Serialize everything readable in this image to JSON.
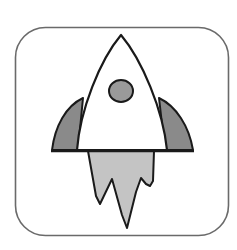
{
  "icon": {
    "name": "rocket-icon",
    "label": "Rocket",
    "colors": {
      "background": "#ffffff",
      "frame_stroke": "#6a6a6a",
      "outline": "#1a1a1a",
      "body_fill": "#ffffff",
      "fin_fill": "#8a8a8a",
      "porthole_fill": "#9a9a9a",
      "flame_fill": "#c4c4c4"
    }
  }
}
